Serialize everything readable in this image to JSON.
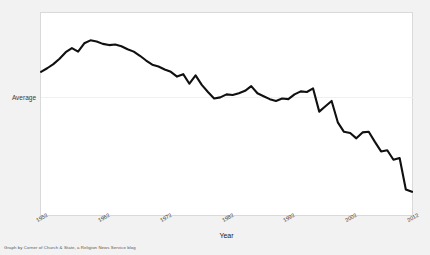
{
  "chart_data": {
    "type": "line",
    "title": "",
    "xlabel": "Year",
    "ylabel": "",
    "grid": true,
    "legend": false,
    "xlim": [
      1952,
      2012
    ],
    "xticks": [
      "1952",
      "1962",
      "1972",
      "1982",
      "1992",
      "2002",
      "2012"
    ],
    "xtick_values": [
      1952,
      1962,
      1972,
      1982,
      1992,
      2002,
      2012
    ],
    "yticks": [
      "Average"
    ],
    "ytick_values": [
      0
    ],
    "ylim": [
      -1.95,
      1.45
    ],
    "y_note": "Values are deviations from the Average reference line (0 = Average).",
    "line_color": "#101010",
    "x": [
      1952,
      1953,
      1954,
      1955,
      1956,
      1957,
      1958,
      1959,
      1960,
      1961,
      1962,
      1963,
      1964,
      1965,
      1966,
      1967,
      1968,
      1969,
      1970,
      1971,
      1972,
      1973,
      1974,
      1975,
      1976,
      1977,
      1978,
      1979,
      1980,
      1981,
      1982,
      1983,
      1984,
      1985,
      1986,
      1987,
      1988,
      1989,
      1990,
      1991,
      1992,
      1993,
      1994,
      1995,
      1996,
      1997,
      1998,
      1999,
      2000,
      2001,
      2002,
      2003,
      2004,
      2005,
      2006,
      2007,
      2008,
      2009,
      2010,
      2011,
      2012
    ],
    "values": [
      0.46,
      0.52,
      0.59,
      0.68,
      0.79,
      0.86,
      0.8,
      0.94,
      0.99,
      0.97,
      0.93,
      0.91,
      0.92,
      0.89,
      0.84,
      0.8,
      0.73,
      0.65,
      0.58,
      0.55,
      0.5,
      0.46,
      0.38,
      0.42,
      0.26,
      0.4,
      0.24,
      0.12,
      0.01,
      0.03,
      0.08,
      0.07,
      0.1,
      0.14,
      0.22,
      0.1,
      0.05,
      0.0,
      -0.03,
      0.01,
      0.0,
      0.08,
      0.13,
      0.12,
      0.18,
      -0.21,
      -0.12,
      -0.03,
      -0.39,
      -0.55,
      -0.57,
      -0.66,
      -0.56,
      -0.55,
      -0.72,
      -0.88,
      -0.86,
      -1.02,
      -0.99,
      -1.52,
      -1.56
    ],
    "series": [
      {
        "name": "Average church attendance index",
        "values": [
          0.46,
          0.52,
          0.59,
          0.68,
          0.79,
          0.86,
          0.8,
          0.94,
          0.99,
          0.97,
          0.93,
          0.91,
          0.92,
          0.89,
          0.84,
          0.8,
          0.73,
          0.65,
          0.58,
          0.55,
          0.5,
          0.46,
          0.38,
          0.42,
          0.26,
          0.4,
          0.24,
          0.12,
          0.01,
          0.03,
          0.08,
          0.07,
          0.1,
          0.14,
          0.22,
          0.1,
          0.05,
          0.0,
          -0.03,
          0.01,
          0.0,
          0.08,
          0.13,
          0.12,
          0.18,
          -0.21,
          -0.12,
          -0.03,
          -0.39,
          -0.55,
          -0.57,
          -0.66,
          -0.56,
          -0.55,
          -0.72,
          -0.88,
          -0.86,
          -1.02,
          -0.99,
          -1.52,
          -1.56
        ]
      }
    ]
  },
  "footer": {
    "credit": "Graph by Corner of Church & State, a Religion News Service blog"
  }
}
